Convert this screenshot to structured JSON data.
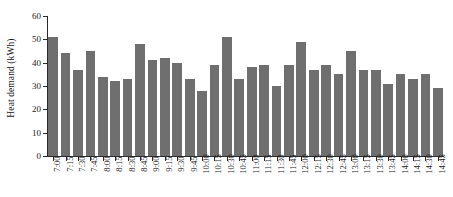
{
  "chart_data": {
    "type": "bar",
    "title": "",
    "xlabel": "",
    "ylabel": "Heat demand (kWh)",
    "ylim": [
      0,
      60
    ],
    "yticks": [
      0,
      10,
      20,
      30,
      40,
      50,
      60
    ],
    "grid": false,
    "legend": null,
    "bar_color": "#706f6f",
    "axis_color": "#2b2b2b",
    "categories": [
      "7:00",
      "7:15",
      "7:30",
      "7:45",
      "8:00",
      "8:15",
      "8:30",
      "8:45",
      "9:00",
      "9:15",
      "9:30",
      "9:45",
      "10:00",
      "10:15",
      "10:30",
      "10:45",
      "11:00",
      "11:15",
      "11:30",
      "11:45",
      "12:00",
      "12:15",
      "12:30",
      "12:45",
      "13:00",
      "13:15",
      "13:30",
      "13:45",
      "14:00",
      "14:15",
      "14:30",
      "14:45"
    ],
    "values": [
      51,
      44,
      37,
      45,
      34,
      32,
      33,
      48,
      41,
      42,
      40,
      33,
      28,
      39,
      51,
      33,
      38,
      39,
      30,
      39,
      49,
      37,
      39,
      35,
      45,
      37,
      37,
      31,
      35,
      33,
      35,
      29
    ]
  }
}
